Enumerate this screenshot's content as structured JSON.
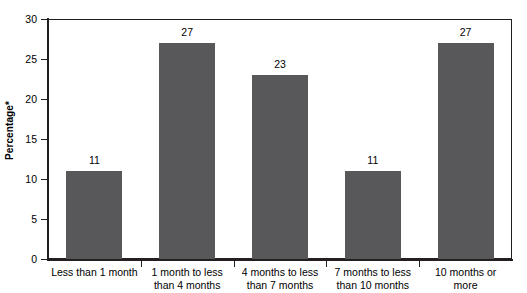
{
  "chart_data": {
    "type": "bar",
    "title": "",
    "xlabel": "",
    "ylabel": "Percentage*",
    "categories": [
      "Less than 1 month",
      "1 month to less than 4 months",
      "4 months to less than 7 months",
      "7 months to less than 10 months",
      "10 months or more"
    ],
    "category_lines": [
      [
        "Less than 1 month"
      ],
      [
        "1 month to less",
        "than 4 months"
      ],
      [
        "4 months to less",
        "than 7 months"
      ],
      [
        "7 months to less",
        "than 10 months"
      ],
      [
        "10 months or",
        "more"
      ]
    ],
    "values": [
      11,
      27,
      23,
      11,
      27
    ],
    "value_labels": [
      "11",
      "27",
      "23",
      "11",
      "27"
    ],
    "ylim": [
      0,
      30
    ],
    "yticks": [
      0,
      5,
      10,
      15,
      20,
      25,
      30
    ],
    "ytick_labels": [
      "0",
      "5",
      "10",
      "15",
      "20",
      "25",
      "30"
    ],
    "grid": false,
    "legend": false,
    "bar_color": "#58585a",
    "axis_color": "#231f20",
    "background_color": "#ffffff"
  }
}
